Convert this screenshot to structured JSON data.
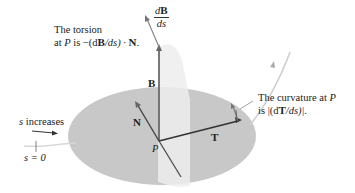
{
  "figure": {
    "labels": {
      "torsion_line1": "The torsion",
      "torsion_line2_prefix": "at ",
      "torsion_point": "P",
      "torsion_line2_suffix": " is −(d",
      "torsion_B": "B",
      "torsion_ds": "/ds) · ",
      "torsion_N": "N",
      "torsion_end": ".",
      "dBds_num_d": "d",
      "dBds_num_B": "B",
      "dBds_den": "ds",
      "B": "B",
      "N": "N",
      "T": "T",
      "P": "P",
      "curvature_line1_prefix": "The curvature at ",
      "curvature_point": "P",
      "curvature_line2_prefix": "is |(d",
      "curvature_T": "T",
      "curvature_line2_suffix": "/ds)|.",
      "s_increases_s": "s",
      "s_increases_rest": " increases",
      "s_zero": "s = 0"
    },
    "colors": {
      "osculating_plane": "#c9c9c9",
      "normal_plane": "#ececec",
      "vector": "#444444",
      "curve": "#d0d0d0",
      "text": "#222222"
    }
  }
}
